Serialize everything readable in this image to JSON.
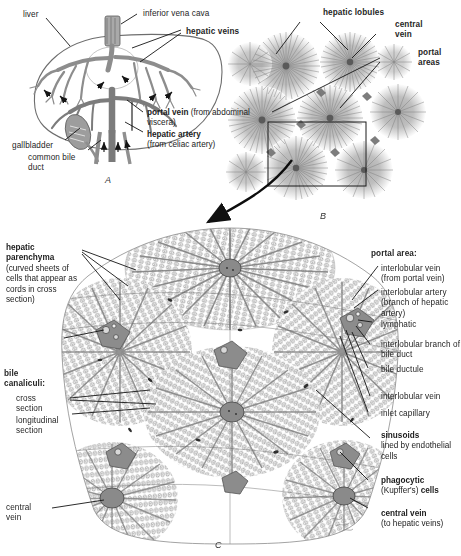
{
  "figure": {
    "background_color": "#ffffff",
    "ink_color": "#252525",
    "tissue_gray": "#8e8e8e"
  },
  "panels": [
    {
      "id": "A",
      "letter": "A",
      "caption": "Liver with hepatic circulation"
    },
    {
      "id": "B",
      "letter": "B",
      "caption": "Hepatic lobules, low magnification"
    },
    {
      "id": "C",
      "letter": "C",
      "caption": "Hepatic lobule histology"
    }
  ],
  "panel_a": {
    "labels": [
      {
        "name": "liver",
        "text": "liver",
        "bold": false
      },
      {
        "name": "inferior-vena-cava",
        "text": "inferior vena cava",
        "bold": false
      },
      {
        "name": "hepatic-veins",
        "text": "hepatic veins",
        "bold": true
      },
      {
        "name": "portal-vein",
        "text": "portal vein",
        "bold": true,
        "sub": "(from abdominal viscera)"
      },
      {
        "name": "hepatic-artery",
        "text": "hepatic artery",
        "bold": true,
        "sub": "(from celiac artery)"
      },
      {
        "name": "gallbladder",
        "text": "gallbladder",
        "bold": false
      },
      {
        "name": "common-bile-duct",
        "text": "common bile duct",
        "bold": false
      }
    ]
  },
  "panel_b": {
    "labels": [
      {
        "name": "hepatic-lobules",
        "text": "hepatic lobules",
        "bold": true
      },
      {
        "name": "central-vein",
        "text": "central vein",
        "bold": true
      },
      {
        "name": "portal-areas",
        "text": "portal areas",
        "bold": true
      }
    ]
  },
  "panel_c": {
    "left_labels": [
      {
        "name": "hepatic-parenchyma",
        "title": "hepatic parenchyma",
        "detail": "(curved sheets of cells that appear as cords in cross section)"
      },
      {
        "name": "bile-canaliculi",
        "title": "bile canaliculi:",
        "items": [
          "cross section",
          "longitudinal section"
        ]
      },
      {
        "name": "central-vein-left",
        "title": "central vein",
        "bold": false
      }
    ],
    "right_labels": [
      {
        "name": "portal-area",
        "title": "portal area:",
        "bold": true
      },
      {
        "name": "interlobular-vein-portal",
        "text": "interlobular vein (from portal vein)",
        "bold": false
      },
      {
        "name": "interlobular-artery",
        "text": "interlobular artery (branch of hepatic artery)",
        "bold": false
      },
      {
        "name": "lymphatic",
        "text": "lymphatic",
        "bold": false
      },
      {
        "name": "interlobular-branch-bile-duct",
        "text": "interlobular branch of bile duct",
        "bold": false
      },
      {
        "name": "bile-ductule",
        "text": "bile ductule",
        "bold": false
      },
      {
        "name": "interlobular-vein",
        "text": "interlobular vein",
        "bold": false
      },
      {
        "name": "inlet-capillary",
        "text": "inlet capillary",
        "bold": false
      },
      {
        "name": "sinusoids",
        "title": "sinusoids",
        "detail": "lined by endothelial cells",
        "bold": true
      },
      {
        "name": "phagocytic-cells",
        "title_a": "phagocytic",
        "title_b": "(Kupffer's) ",
        "title_c": "cells",
        "bold": true
      },
      {
        "name": "central-vein-right",
        "title": "central vein",
        "detail": "(to hepatic veins)",
        "bold": true
      }
    ]
  },
  "artist_signature": {
    "name": "artist-signature",
    "text": ""
  }
}
